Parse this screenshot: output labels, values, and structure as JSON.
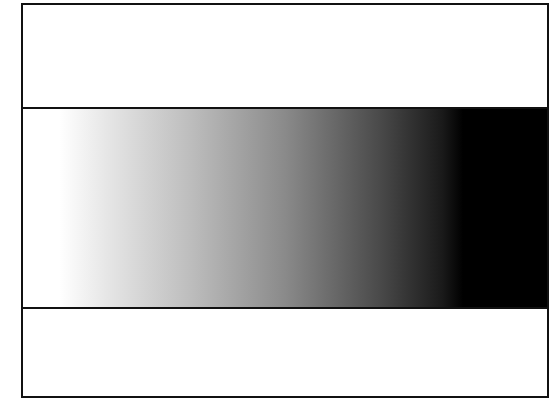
{
  "figure": {
    "gradient": {
      "direction": "left-to-right",
      "stops": [
        {
          "color": "#ffffff",
          "position_fraction": 0.0
        },
        {
          "color": "#ffffff",
          "position_fraction": 0.07
        },
        {
          "color": "#e6e6e6",
          "position_fraction": 0.16
        },
        {
          "color": "#bdbdbd",
          "position_fraction": 0.32
        },
        {
          "color": "#8a8a8a",
          "position_fraction": 0.5
        },
        {
          "color": "#4a4a4a",
          "position_fraction": 0.68
        },
        {
          "color": "#1a1a1a",
          "position_fraction": 0.8
        },
        {
          "color": "#000000",
          "position_fraction": 0.84
        },
        {
          "color": "#000000",
          "position_fraction": 1.0
        }
      ]
    },
    "colors": {
      "frame_border": "#111111",
      "background": "#ffffff"
    }
  }
}
